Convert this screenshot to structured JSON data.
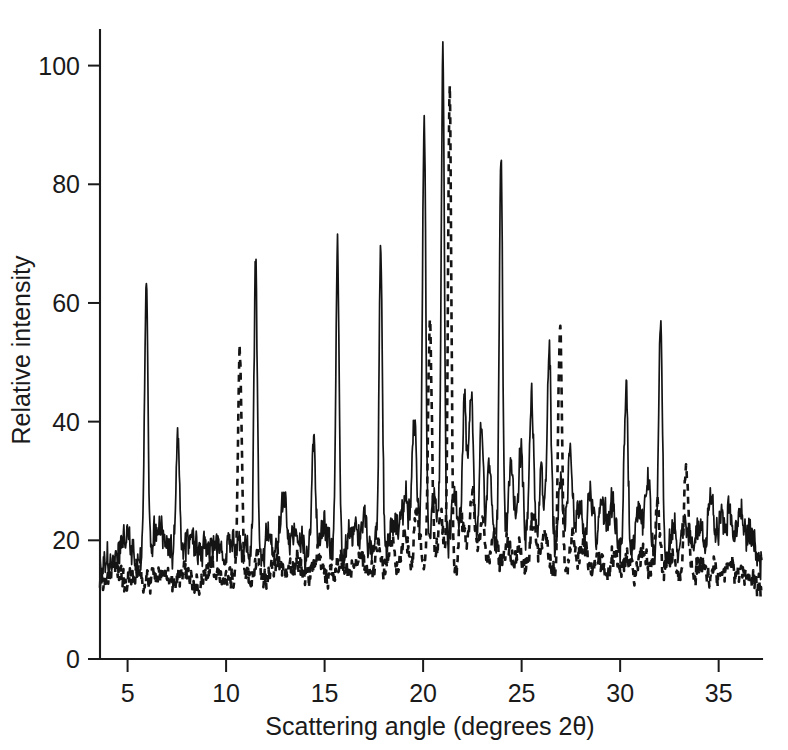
{
  "chart_data": {
    "type": "line",
    "title": "",
    "xlabel": "Scattering angle (degrees 2θ)",
    "ylabel": "Relative intensity",
    "xlim": [
      3.6,
      37.2
    ],
    "ylim": [
      0,
      106
    ],
    "xticks": [
      5,
      10,
      15,
      20,
      25,
      30,
      35
    ],
    "yticks": [
      0,
      20,
      40,
      60,
      80,
      100
    ],
    "xtick_labels": [
      "5",
      "10",
      "15",
      "20",
      "25",
      "30",
      "35"
    ],
    "ytick_labels": [
      "0",
      "20",
      "40",
      "60",
      "80",
      "100"
    ],
    "grid": false,
    "legend": "none",
    "series": [
      {
        "name": "sample-solid",
        "style": "solid",
        "baseline": 16.5,
        "noise_amplitude": 3.2,
        "noise_seed": 1731,
        "peaks": [
          {
            "x": 4.5,
            "height": 2.0,
            "width": 0.22
          },
          {
            "x": 5.0,
            "height": 3.0,
            "width": 0.2
          },
          {
            "x": 5.95,
            "height": 47.5,
            "width": 0.085
          },
          {
            "x": 6.45,
            "height": 5.0,
            "width": 0.16
          },
          {
            "x": 6.85,
            "height": 4.0,
            "width": 0.16
          },
          {
            "x": 7.55,
            "height": 19.5,
            "width": 0.095
          },
          {
            "x": 8.2,
            "height": 3.5,
            "width": 0.18
          },
          {
            "x": 8.9,
            "height": 3.0,
            "width": 0.2
          },
          {
            "x": 9.7,
            "height": 2.5,
            "width": 0.2
          },
          {
            "x": 10.4,
            "height": 3.0,
            "width": 0.2
          },
          {
            "x": 11.5,
            "height": 49.5,
            "width": 0.085
          },
          {
            "x": 12.2,
            "height": 4.0,
            "width": 0.18
          },
          {
            "x": 12.9,
            "height": 7.5,
            "width": 0.16
          },
          {
            "x": 13.5,
            "height": 4.0,
            "width": 0.18
          },
          {
            "x": 14.45,
            "height": 19.0,
            "width": 0.1
          },
          {
            "x": 15.0,
            "height": 4.5,
            "width": 0.18
          },
          {
            "x": 15.65,
            "height": 50.5,
            "width": 0.085
          },
          {
            "x": 16.4,
            "height": 5.0,
            "width": 0.18
          },
          {
            "x": 17.0,
            "height": 4.5,
            "width": 0.18
          },
          {
            "x": 17.85,
            "height": 49.5,
            "width": 0.085
          },
          {
            "x": 18.5,
            "height": 5.5,
            "width": 0.18
          },
          {
            "x": 19.1,
            "height": 9.0,
            "width": 0.16
          },
          {
            "x": 19.55,
            "height": 22.0,
            "width": 0.12
          },
          {
            "x": 20.05,
            "height": 74.5,
            "width": 0.085
          },
          {
            "x": 20.6,
            "height": 9.0,
            "width": 0.16
          },
          {
            "x": 21.0,
            "height": 83.5,
            "width": 0.085
          },
          {
            "x": 21.6,
            "height": 9.0,
            "width": 0.16
          },
          {
            "x": 22.1,
            "height": 26.0,
            "width": 0.11
          },
          {
            "x": 22.45,
            "height": 28.0,
            "width": 0.11
          },
          {
            "x": 22.95,
            "height": 22.5,
            "width": 0.11
          },
          {
            "x": 23.35,
            "height": 14.0,
            "width": 0.13
          },
          {
            "x": 23.95,
            "height": 67.5,
            "width": 0.085
          },
          {
            "x": 24.45,
            "height": 13.5,
            "width": 0.14
          },
          {
            "x": 24.95,
            "height": 17.0,
            "width": 0.13
          },
          {
            "x": 25.5,
            "height": 27.5,
            "width": 0.11
          },
          {
            "x": 26.0,
            "height": 12.0,
            "width": 0.14
          },
          {
            "x": 26.4,
            "height": 35.5,
            "width": 0.1
          },
          {
            "x": 26.95,
            "height": 12.0,
            "width": 0.14
          },
          {
            "x": 27.45,
            "height": 17.0,
            "width": 0.13
          },
          {
            "x": 27.95,
            "height": 9.0,
            "width": 0.16
          },
          {
            "x": 28.5,
            "height": 11.0,
            "width": 0.15
          },
          {
            "x": 29.1,
            "height": 9.0,
            "width": 0.16
          },
          {
            "x": 29.6,
            "height": 8.0,
            "width": 0.16
          },
          {
            "x": 30.3,
            "height": 29.5,
            "width": 0.1
          },
          {
            "x": 30.9,
            "height": 9.0,
            "width": 0.16
          },
          {
            "x": 31.4,
            "height": 12.5,
            "width": 0.14
          },
          {
            "x": 32.05,
            "height": 38.0,
            "width": 0.095
          },
          {
            "x": 32.7,
            "height": 6.0,
            "width": 0.17
          },
          {
            "x": 33.3,
            "height": 5.5,
            "width": 0.18
          },
          {
            "x": 34.0,
            "height": 5.0,
            "width": 0.18
          },
          {
            "x": 34.6,
            "height": 10.0,
            "width": 0.16
          },
          {
            "x": 35.1,
            "height": 7.0,
            "width": 0.17
          },
          {
            "x": 35.6,
            "height": 9.0,
            "width": 0.16
          },
          {
            "x": 36.1,
            "height": 6.5,
            "width": 0.17
          },
          {
            "x": 36.6,
            "height": 4.0,
            "width": 0.18
          }
        ],
        "peak_values": [
          {
            "x": 5.95,
            "y": 64
          },
          {
            "x": 7.55,
            "y": 36
          },
          {
            "x": 11.5,
            "y": 66
          },
          {
            "x": 14.45,
            "y": 36
          },
          {
            "x": 15.65,
            "y": 67
          },
          {
            "x": 17.85,
            "y": 66
          },
          {
            "x": 20.05,
            "y": 91
          },
          {
            "x": 21.0,
            "y": 100
          },
          {
            "x": 23.95,
            "y": 84
          },
          {
            "x": 22.45,
            "y": 45
          },
          {
            "x": 26.4,
            "y": 52
          },
          {
            "x": 30.3,
            "y": 46
          },
          {
            "x": 32.05,
            "y": 54.5
          }
        ]
      },
      {
        "name": "reference-dashed",
        "style": "dashed",
        "baseline": 12.5,
        "noise_amplitude": 2.2,
        "noise_seed": 913,
        "peaks": [
          {
            "x": 4.4,
            "height": 1.5,
            "width": 0.22
          },
          {
            "x": 5.4,
            "height": 1.5,
            "width": 0.22
          },
          {
            "x": 6.6,
            "height": 1.5,
            "width": 0.22
          },
          {
            "x": 7.9,
            "height": 1.5,
            "width": 0.22
          },
          {
            "x": 9.2,
            "height": 2.0,
            "width": 0.22
          },
          {
            "x": 10.7,
            "height": 37.5,
            "width": 0.095
          },
          {
            "x": 11.6,
            "height": 2.5,
            "width": 0.2
          },
          {
            "x": 12.6,
            "height": 3.0,
            "width": 0.2
          },
          {
            "x": 13.6,
            "height": 2.5,
            "width": 0.2
          },
          {
            "x": 14.7,
            "height": 3.0,
            "width": 0.2
          },
          {
            "x": 15.8,
            "height": 3.0,
            "width": 0.2
          },
          {
            "x": 16.8,
            "height": 4.0,
            "width": 0.2
          },
          {
            "x": 17.7,
            "height": 5.0,
            "width": 0.18
          },
          {
            "x": 18.4,
            "height": 5.5,
            "width": 0.18
          },
          {
            "x": 19.1,
            "height": 8.0,
            "width": 0.16
          },
          {
            "x": 19.7,
            "height": 11.0,
            "width": 0.14
          },
          {
            "x": 20.35,
            "height": 42.0,
            "width": 0.1
          },
          {
            "x": 20.9,
            "height": 10.0,
            "width": 0.15
          },
          {
            "x": 21.35,
            "height": 80.5,
            "width": 0.085
          },
          {
            "x": 21.95,
            "height": 10.0,
            "width": 0.15
          },
          {
            "x": 22.5,
            "height": 14.0,
            "width": 0.14
          },
          {
            "x": 23.0,
            "height": 9.0,
            "width": 0.16
          },
          {
            "x": 23.6,
            "height": 7.0,
            "width": 0.17
          },
          {
            "x": 24.3,
            "height": 6.0,
            "width": 0.18
          },
          {
            "x": 24.9,
            "height": 5.0,
            "width": 0.18
          },
          {
            "x": 25.6,
            "height": 9.5,
            "width": 0.15
          },
          {
            "x": 26.2,
            "height": 8.0,
            "width": 0.16
          },
          {
            "x": 26.95,
            "height": 41.5,
            "width": 0.095
          },
          {
            "x": 27.6,
            "height": 7.0,
            "width": 0.17
          },
          {
            "x": 28.2,
            "height": 5.0,
            "width": 0.18
          },
          {
            "x": 28.9,
            "height": 4.0,
            "width": 0.19
          },
          {
            "x": 29.7,
            "height": 3.5,
            "width": 0.19
          },
          {
            "x": 30.4,
            "height": 4.0,
            "width": 0.19
          },
          {
            "x": 31.2,
            "height": 4.5,
            "width": 0.19
          },
          {
            "x": 31.9,
            "height": 14.0,
            "width": 0.13
          },
          {
            "x": 32.6,
            "height": 4.0,
            "width": 0.19
          },
          {
            "x": 33.35,
            "height": 20.0,
            "width": 0.12
          },
          {
            "x": 34.0,
            "height": 3.0,
            "width": 0.2
          },
          {
            "x": 34.8,
            "height": 2.5,
            "width": 0.2
          },
          {
            "x": 35.6,
            "height": 2.5,
            "width": 0.2
          },
          {
            "x": 36.3,
            "height": 3.0,
            "width": 0.2
          }
        ],
        "peak_values": [
          {
            "x": 10.7,
            "y": 50
          },
          {
            "x": 20.35,
            "y": 54
          },
          {
            "x": 21.35,
            "y": 93
          },
          {
            "x": 26.95,
            "y": 54
          },
          {
            "x": 31.9,
            "y": 26
          },
          {
            "x": 33.35,
            "y": 32
          }
        ]
      }
    ]
  },
  "axes": {
    "x_title": "Scattering angle (degrees 2θ)",
    "y_title": "Relative intensity"
  }
}
